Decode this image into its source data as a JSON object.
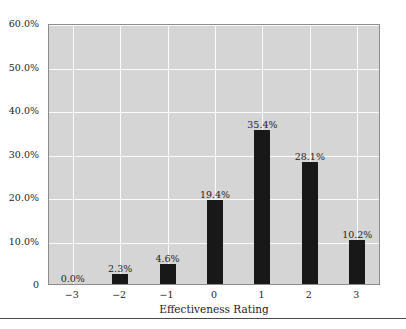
{
  "chart_data": {
    "type": "bar",
    "title": "",
    "subtitle": "",
    "xlabel": "Effectiveness Rating",
    "ylabel": "",
    "categories": [
      "−3",
      "−2",
      "−1",
      "0",
      "1",
      "2",
      "3"
    ],
    "values": [
      0.0,
      2.3,
      4.6,
      19.4,
      35.4,
      28.1,
      10.2
    ],
    "data_labels": [
      "0.0%",
      "2.3%",
      "4.6%",
      "19.4%",
      "35.4%",
      "28.1%",
      "10.2%"
    ],
    "ylim": [
      0,
      60
    ],
    "ytick_values": [
      0,
      10,
      20,
      30,
      40,
      50,
      60
    ],
    "ytick_labels": [
      "0",
      "10.0%",
      "20.0%",
      "30.0%",
      "40.0%",
      "50.0%",
      "60.0%"
    ],
    "grid": true,
    "legend": false,
    "legend_position": "none",
    "series": [
      {
        "name": "Effectiveness Rating Distribution",
        "values": [
          0.0,
          2.3,
          4.6,
          19.4,
          35.4,
          28.1,
          10.2
        ]
      }
    ],
    "colors": {
      "bar": "#181818",
      "plot_background": "#d5d5d5",
      "gridline": "#fbfbfb",
      "axis_border": "#8c8c8c",
      "text": "#232323",
      "figure_background": "#ffffff",
      "rule": "#4a4a4a"
    }
  }
}
